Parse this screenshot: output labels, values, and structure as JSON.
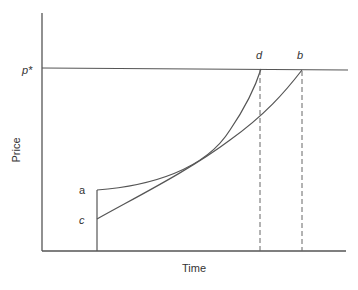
{
  "diagram": {
    "type": "price-time path diagram",
    "axes": {
      "y_label": "Price",
      "x_label": "Time"
    },
    "reference_line": {
      "label": "p*"
    },
    "points": {
      "a": "a",
      "b": "b",
      "c": "c",
      "d": "d"
    },
    "curves": [
      {
        "name": "path-a-to-d",
        "from": "a",
        "to": "d",
        "shape": "convex, steeper"
      },
      {
        "name": "path-c-to-b",
        "from": "c",
        "to": "b",
        "shape": "nearly linear, gentler"
      }
    ],
    "colors": {
      "line": "#444444",
      "dashed": "#666666",
      "text": "#333333"
    }
  }
}
